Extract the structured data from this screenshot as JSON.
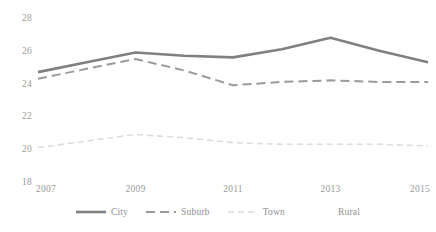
{
  "chart_data": {
    "type": "line",
    "title": "",
    "subtitle": "",
    "xlabel": "",
    "ylabel": "",
    "x": [
      2007,
      2008,
      2009,
      2010,
      2011,
      2012,
      2013,
      2014,
      2015
    ],
    "categories": [
      "2007",
      "2008",
      "2009",
      "2010",
      "2011",
      "2012",
      "2013",
      "2014",
      "2015"
    ],
    "xlim": [
      2007,
      2015
    ],
    "ylim": [
      18,
      28
    ],
    "y_ticks": [
      28,
      26,
      24,
      22,
      20,
      18
    ],
    "x_ticks": [
      2007,
      2009,
      2011,
      2013,
      2015
    ],
    "x_tick_labels": [
      "2007",
      "2009",
      "2011",
      "2013",
      "2015"
    ],
    "y_tick_labels": [
      "28",
      "26",
      "24",
      "22",
      "20",
      "18"
    ],
    "grid": false,
    "legend_position": "bottom",
    "series": [
      {
        "name": "City",
        "color": "#808080",
        "style": "solid",
        "width": 2.6,
        "values": [
          24.7,
          25.3,
          25.9,
          25.7,
          25.6,
          26.1,
          26.8,
          26.0,
          25.3
        ]
      },
      {
        "name": "Suburb",
        "color": "#9a9a9a",
        "style": "dashed",
        "width": 2.0,
        "values": [
          24.3,
          24.9,
          25.5,
          24.8,
          23.9,
          24.1,
          24.2,
          24.1,
          24.1
        ]
      },
      {
        "name": "Town",
        "color": "#dcdcdc",
        "style": "dotted",
        "width": 1.6,
        "values": [
          20.1,
          20.5,
          20.9,
          20.7,
          20.4,
          20.3,
          20.3,
          20.3,
          20.2
        ]
      },
      {
        "name": "Rural",
        "color": "#fdfdfd",
        "style": "solid",
        "width": 1.4,
        "values": [
          null,
          null,
          null,
          null,
          null,
          null,
          null,
          null,
          null
        ]
      }
    ]
  },
  "axes": {
    "y_labels": [
      "28",
      "26",
      "24",
      "22",
      "20",
      "18"
    ],
    "x_labels": [
      "2007",
      "2009",
      "2011",
      "2013",
      "2015"
    ]
  },
  "legend": {
    "items": [
      {
        "label": "City"
      },
      {
        "label": "Suburb"
      },
      {
        "label": "Town"
      },
      {
        "label": "Rural"
      }
    ]
  }
}
